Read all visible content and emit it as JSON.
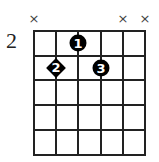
{
  "chord": {
    "start_fret_label": "2",
    "strings": 6,
    "frets": 5,
    "muted_strings": [
      {
        "string": 1,
        "symbol": "×"
      },
      {
        "string": 5,
        "symbol": "×"
      },
      {
        "string": 6,
        "symbol": "×"
      }
    ],
    "fingers": [
      {
        "finger": "1",
        "string": 3,
        "fret": 1,
        "shape": "circle"
      },
      {
        "finger": "2",
        "string": 2,
        "fret": 2,
        "shape": "diamond"
      },
      {
        "finger": "3",
        "string": 4,
        "fret": 2,
        "shape": "circle"
      }
    ],
    "colors": {
      "line": "#222222",
      "dot": "#000000",
      "dot_text": "#ffffff"
    }
  }
}
